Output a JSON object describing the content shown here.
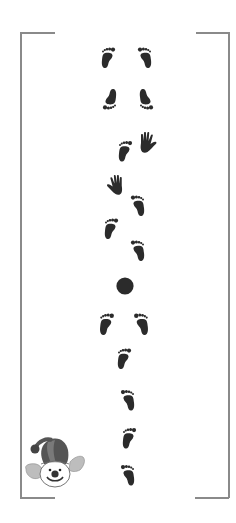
{
  "page": {
    "background": "#ffffff"
  },
  "colors": {
    "print": "#2b2b2b",
    "frame": "#8a8a8a",
    "clown_hat": "#555555",
    "clown_hair": "#bdbdbd",
    "clown_face": "#ffffff"
  },
  "frame": {
    "left": 20,
    "right": 229,
    "top": 32,
    "bottom": 497,
    "corner_length": 35
  },
  "prints": [
    {
      "type": "foot",
      "side": "left",
      "x": 100,
      "y": 47,
      "w": 16,
      "h": 22,
      "rotate": 0
    },
    {
      "type": "foot",
      "side": "right",
      "x": 137,
      "y": 47,
      "w": 16,
      "h": 22,
      "rotate": 0
    },
    {
      "type": "foot",
      "side": "left",
      "x": 102,
      "y": 88,
      "w": 16,
      "h": 22,
      "rotate": 180
    },
    {
      "type": "foot",
      "side": "right",
      "x": 138,
      "y": 88,
      "w": 16,
      "h": 22,
      "rotate": 180
    },
    {
      "type": "foot",
      "side": "left",
      "x": 117,
      "y": 140,
      "w": 16,
      "h": 23,
      "rotate": 0
    },
    {
      "type": "hand",
      "side": "right",
      "x": 136,
      "y": 131,
      "w": 22,
      "h": 23,
      "rotate": 0
    },
    {
      "type": "hand",
      "side": "left",
      "x": 105,
      "y": 174,
      "w": 22,
      "h": 22,
      "rotate": 0
    },
    {
      "type": "foot",
      "side": "right",
      "x": 130,
      "y": 195,
      "w": 16,
      "h": 22,
      "rotate": 0
    },
    {
      "type": "foot",
      "side": "left",
      "x": 103,
      "y": 218,
      "w": 16,
      "h": 22,
      "rotate": 0
    },
    {
      "type": "foot",
      "side": "right",
      "x": 130,
      "y": 240,
      "w": 16,
      "h": 22,
      "rotate": 0
    },
    {
      "type": "ball",
      "x": 116,
      "y": 277,
      "w": 18,
      "h": 18
    },
    {
      "type": "foot",
      "side": "left",
      "x": 98,
      "y": 313,
      "w": 17,
      "h": 23,
      "rotate": 0
    },
    {
      "type": "foot",
      "side": "right",
      "x": 133,
      "y": 313,
      "w": 17,
      "h": 23,
      "rotate": 0
    },
    {
      "type": "foot",
      "side": "left",
      "x": 116,
      "y": 348,
      "w": 16,
      "h": 22,
      "rotate": 0
    },
    {
      "type": "foot",
      "side": "right",
      "x": 120,
      "y": 389,
      "w": 16,
      "h": 23,
      "rotate": 0
    },
    {
      "type": "foot",
      "side": "left",
      "x": 121,
      "y": 427,
      "w": 16,
      "h": 23,
      "rotate": 0
    },
    {
      "type": "foot",
      "side": "right",
      "x": 120,
      "y": 464,
      "w": 16,
      "h": 23,
      "rotate": 0
    }
  ],
  "clown": {
    "x": 22,
    "y": 430,
    "w": 66,
    "h": 58
  }
}
